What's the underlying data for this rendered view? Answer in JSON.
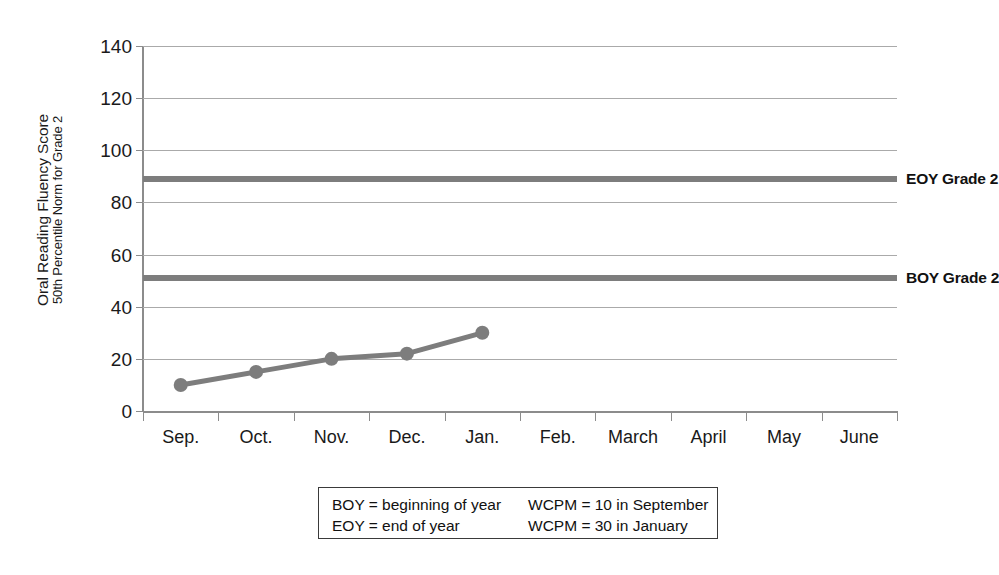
{
  "chart_data": {
    "type": "line",
    "title": "",
    "xlabel": "",
    "ylabel": "Oral Reading Fluency Score",
    "ylabel_sub": "50th Percentile Norm for Grade 2",
    "categories": [
      "Sep.",
      "Oct.",
      "Nov.",
      "Dec.",
      "Jan.",
      "Feb.",
      "March",
      "April",
      "May",
      "June"
    ],
    "ylim": [
      0,
      140
    ],
    "yticks": [
      0,
      20,
      40,
      60,
      80,
      100,
      120,
      140
    ],
    "grid": "horizontal",
    "legend_position": "none",
    "series": [
      {
        "name": "Student ORF",
        "type": "line-with-markers",
        "color": "#7d7d7d",
        "x": [
          "Sep.",
          "Oct.",
          "Nov.",
          "Dec.",
          "Jan."
        ],
        "values": [
          10,
          15,
          20,
          22,
          30
        ]
      }
    ],
    "reference_lines": [
      {
        "label": "EOY Grade 2",
        "value": 89,
        "color": "#7d7d7d"
      },
      {
        "label": "BOY Grade 2",
        "value": 51,
        "color": "#7d7d7d"
      }
    ],
    "notes": [
      {
        "left": "BOY = beginning of year",
        "right": "WCPM = 10 in September"
      },
      {
        "left": "EOY = end of year",
        "right": "WCPM = 30 in January"
      }
    ]
  }
}
